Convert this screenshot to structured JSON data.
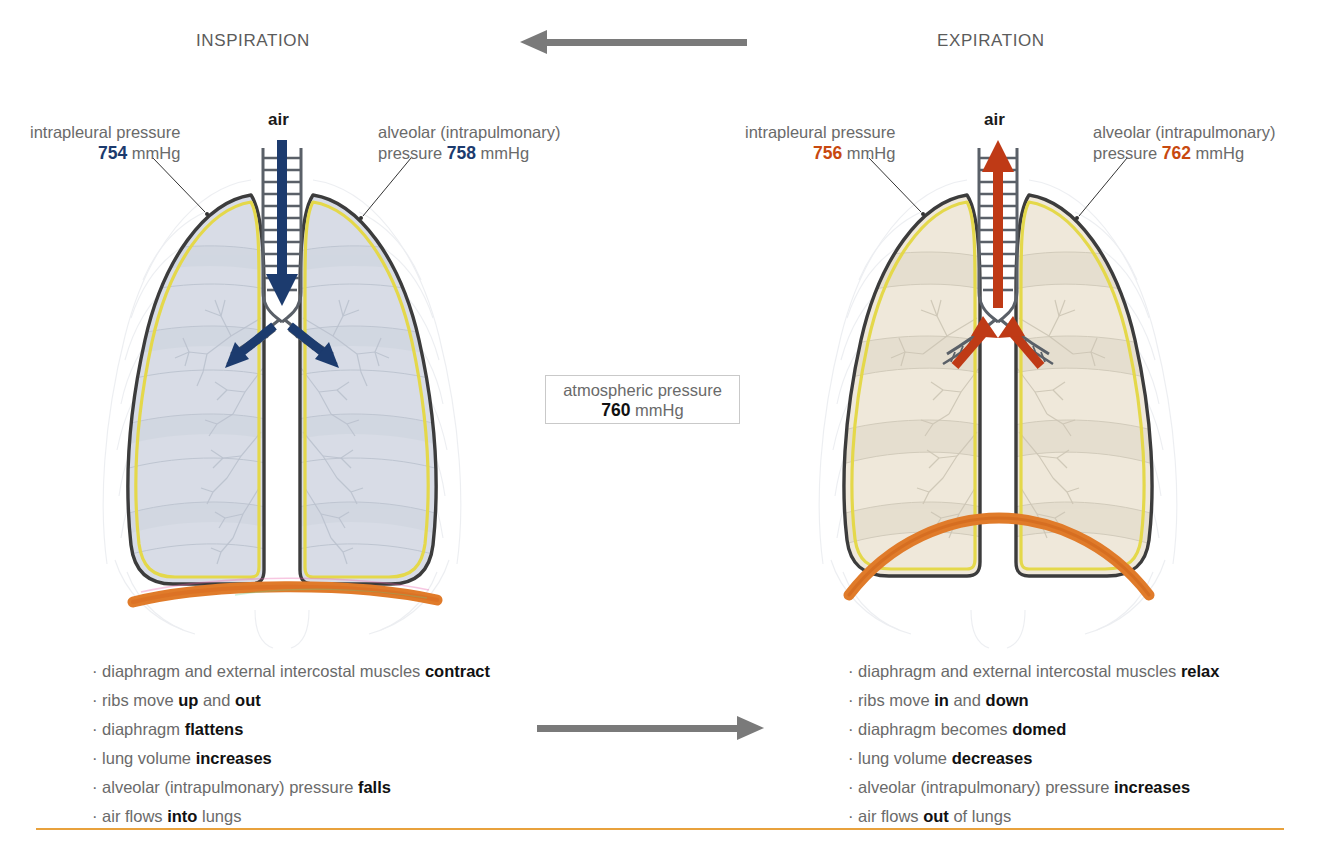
{
  "figure": {
    "phases": [
      {
        "key": "inspiration",
        "title": "INSPIRATION"
      },
      {
        "key": "expiration",
        "title": "EXPIRATION"
      }
    ],
    "air_label": "air",
    "unit": "mmHg",
    "atmospheric": {
      "label": "atmospheric pressure",
      "value": "760",
      "unit": "mmHg"
    },
    "inspiration": {
      "intrapleural": {
        "label": "intrapleural pressure",
        "value": "754",
        "unit": "mmHg"
      },
      "alveolar": {
        "label_line1": "alveolar (intrapulmonary)",
        "label_line2": "pressure",
        "value": "758",
        "unit": "mmHg"
      },
      "air_label": "air",
      "bullets": [
        {
          "text_before": "diaphragm and external intercostal muscles ",
          "bold": "contract",
          "text_after": ""
        },
        {
          "text_before": "ribs move ",
          "bold": "up",
          "text_after": " and ",
          "bold2": "out",
          "text_after2": ""
        },
        {
          "text_before": "diaphragm ",
          "bold": "flattens",
          "text_after": ""
        },
        {
          "text_before": "lung volume ",
          "bold": "increases",
          "text_after": ""
        },
        {
          "text_before": "alveolar (intrapulmonary) pressure ",
          "bold": "falls",
          "text_after": ""
        },
        {
          "text_before": "air flows ",
          "bold": "into",
          "text_after": " lungs"
        }
      ]
    },
    "expiration": {
      "intrapleural": {
        "label": "intrapleural pressure",
        "value": "756",
        "unit": "mmHg"
      },
      "alveolar": {
        "label_line1": "alveolar (intrapulmonary)",
        "label_line2": "pressure",
        "value": "762",
        "unit": "mmHg"
      },
      "air_label": "air",
      "bullets": [
        {
          "text_before": "diaphragm and external intercostal muscles ",
          "bold": "relax",
          "text_after": ""
        },
        {
          "text_before": "ribs move ",
          "bold": "in",
          "text_after": " and ",
          "bold2": "down",
          "text_after2": ""
        },
        {
          "text_before": "diaphragm becomes ",
          "bold": "domed",
          "text_after": ""
        },
        {
          "text_before": "lung volume ",
          "bold": "decreases",
          "text_after": ""
        },
        {
          "text_before": "alveolar (intrapulmonary) pressure ",
          "bold": "increases",
          "text_after": ""
        },
        {
          "text_before": "air flows ",
          "bold": "out",
          "text_after": " of lungs"
        }
      ]
    },
    "colors": {
      "inspiration_accent": "#1c3b6e",
      "expiration_accent": "#c8490f",
      "pleura_yellow": "#e4d84a",
      "lung_outline": "#3c3c3c",
      "diaphragm_orange": "#e07b2a",
      "grey_arrow": "#7a7a7a",
      "rule_orange": "#e8a13c",
      "lung_fill_inspiration": "#d8dce6",
      "lung_fill_expiration": "#efe8da",
      "text_grey": "#6a6a6a"
    },
    "bullet_marker": "·",
    "bottom_rule": true
  }
}
